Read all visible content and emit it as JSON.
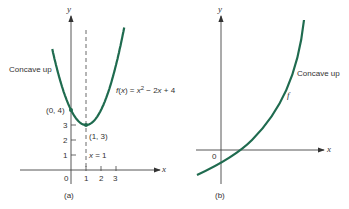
{
  "chart_data": [
    {
      "type": "line",
      "panel": "(a)",
      "title": "",
      "function_label": "f(x) = x² − 2x + 4",
      "annotation_concavity": "Concave up",
      "xlabel": "x",
      "ylabel": "y",
      "x_ticks": [
        "0",
        "1",
        "2",
        "3"
      ],
      "y_ticks": [
        "1",
        "2",
        "3"
      ],
      "points": [
        {
          "label": "(0, 4)",
          "x": 0,
          "y": 4
        },
        {
          "label": "(1, 3)",
          "x": 1,
          "y": 3
        }
      ],
      "vertical_line": {
        "label": "x = 1",
        "x": 1,
        "style": "dashed"
      },
      "series": [
        {
          "name": "f(x) = x^2 - 2x + 4",
          "x": [
            -1.2,
            -1,
            -0.5,
            0,
            0.5,
            1,
            1.5,
            2,
            2.5,
            3,
            3.2
          ],
          "values": [
            8.84,
            7,
            5.25,
            4,
            3.25,
            3,
            3.25,
            4,
            5.25,
            7,
            7.84
          ]
        }
      ],
      "color": "#1f6b4f"
    },
    {
      "type": "line",
      "panel": "(b)",
      "title": "",
      "function_label": "f",
      "annotation_concavity": "Concave up",
      "xlabel": "x",
      "ylabel": "y",
      "x_ticks": [
        "0"
      ],
      "series": [
        {
          "name": "f",
          "shape": "increasing exponential-like curve, crossing x-axis slightly right of origin, concave up"
        }
      ],
      "color": "#1f6b4f"
    }
  ],
  "panel_a": {
    "y_axis_label": "y",
    "x_axis_label": "x",
    "concave_label": "Concave up",
    "func_prefix": "f(x) = x",
    "func_exp": "2",
    "func_suffix": " − 2x + 4",
    "point_0_4": "(0, 4)",
    "point_1_3": "(1, 3)",
    "line_label": "x = 1",
    "tick_x": [
      "0",
      "1",
      "2",
      "3"
    ],
    "tick_y": [
      "1",
      "2",
      "3"
    ],
    "caption": "(a)"
  },
  "panel_b": {
    "y_axis_label": "y",
    "x_axis_label": "x",
    "concave_label": "Concave up",
    "func_label": "f",
    "origin_label": "0",
    "caption": "(b)"
  }
}
